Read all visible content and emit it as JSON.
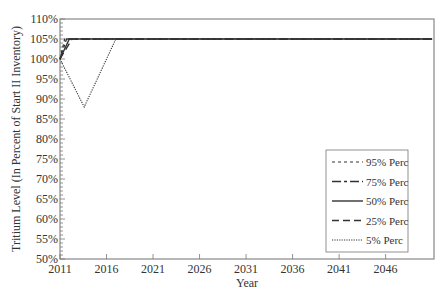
{
  "chart_data": {
    "type": "line",
    "title": "",
    "xlabel": "Year",
    "ylabel": "Tritium Level (In Percent of Start II Inventory)",
    "xlim": [
      2011,
      2051.2
    ],
    "ylim": [
      50,
      110
    ],
    "x_ticks": [
      2011,
      2016,
      2021,
      2026,
      2031,
      2036,
      2041,
      2046
    ],
    "y_ticks": [
      50,
      55,
      60,
      65,
      70,
      75,
      80,
      85,
      90,
      95,
      100,
      105,
      110
    ],
    "y_tick_labels": [
      "50%",
      "55%",
      "60%",
      "65%",
      "70%",
      "75%",
      "80%",
      "85%",
      "90%",
      "95%",
      "100%",
      "105%",
      "110%"
    ],
    "grid": false,
    "legend_position": "lower right",
    "series": [
      {
        "name": "95% Perc",
        "style": "dashed",
        "points": [
          [
            2011,
            100
          ],
          [
            2011.5,
            105
          ],
          [
            2051,
            105
          ]
        ]
      },
      {
        "name": "75% Perc",
        "style": "longdash-short",
        "points": [
          [
            2011,
            100
          ],
          [
            2011.7,
            105
          ],
          [
            2051,
            105
          ]
        ]
      },
      {
        "name": "50% Perc",
        "style": "solid",
        "points": [
          [
            2011,
            100
          ],
          [
            2012,
            105
          ],
          [
            2051,
            105
          ]
        ]
      },
      {
        "name": "25% Perc",
        "style": "longdash",
        "points": [
          [
            2011,
            100
          ],
          [
            2012.3,
            105
          ],
          [
            2051,
            105
          ]
        ]
      },
      {
        "name": "5% Perc",
        "style": "dotted",
        "points": [
          [
            2011,
            100
          ],
          [
            2013.6,
            88
          ],
          [
            2017,
            105
          ],
          [
            2051,
            105
          ]
        ]
      }
    ]
  }
}
